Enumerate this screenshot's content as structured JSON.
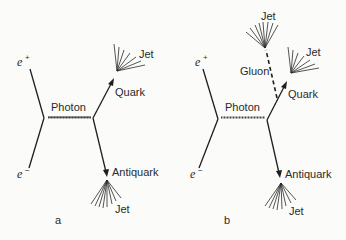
{
  "figure": {
    "type": "feynman-diagram",
    "background": "#fbfbf9",
    "ink": "#1e1e1e"
  },
  "panels": [
    {
      "id": "a",
      "caption": "a",
      "incoming": [
        {
          "label": "e",
          "charge": "+"
        },
        {
          "label": "e",
          "charge": "−"
        }
      ],
      "propagator": "Photon",
      "outgoing": [
        {
          "particle": "Quark",
          "jet": "Jet"
        },
        {
          "particle": "Antiquark",
          "jet": "Jet"
        }
      ]
    },
    {
      "id": "b",
      "caption": "b",
      "incoming": [
        {
          "label": "e",
          "charge": "+"
        },
        {
          "label": "e",
          "charge": "−"
        }
      ],
      "propagator": "Photon",
      "outgoing": [
        {
          "particle": "Quark",
          "jet": "Jet"
        },
        {
          "particle": "Antiquark",
          "jet": "Jet"
        },
        {
          "particle": "Gluon",
          "jet": "Jet"
        }
      ]
    }
  ]
}
